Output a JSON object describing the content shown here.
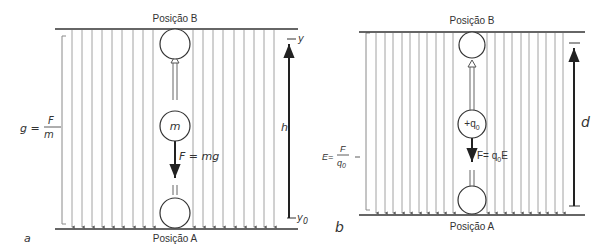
{
  "panel_a": {
    "tag": "a",
    "top_label": "Posição B",
    "bottom_label": "Posição A",
    "field_formula_lhs": "g =",
    "field_formula_num": "F",
    "field_formula_den": "m",
    "particle_label": "m",
    "force_label": "F = mg",
    "height_label": "h",
    "top_coord": "y",
    "bottom_coord": "y0_base",
    "bottom_coord_base": "y",
    "bottom_coord_sub": "0"
  },
  "panel_b": {
    "tag": "b",
    "top_label": "Posição B",
    "bottom_label": "Posição A",
    "field_formula_lhs": "E=",
    "field_formula_num": "F",
    "field_formula_den_base": "q",
    "field_formula_den_sub": "0",
    "particle_label_base": "+q",
    "particle_label_sub": "0",
    "force_label_lhs": "F= q",
    "force_label_sub": "0",
    "force_label_rhs": "E",
    "distance_label": "d"
  },
  "colors": {
    "field_line": "#8a8a8a",
    "plate": "#333333",
    "arrow": "#222222",
    "text": "#333333"
  }
}
